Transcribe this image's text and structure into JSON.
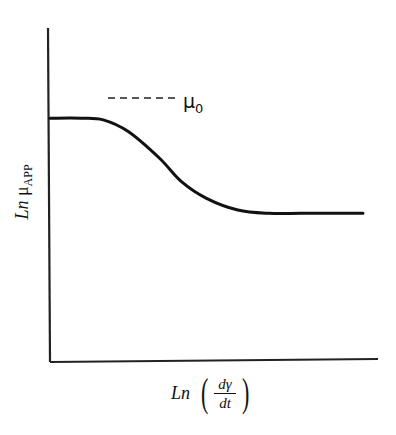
{
  "chart_data": {
    "type": "line",
    "title": "",
    "xlabel": "Ln (dγ/dt)",
    "ylabel": "Ln μAPP",
    "xlabel_parts": {
      "prefix": "Ln",
      "numerator": "dγ",
      "denominator": "dt"
    },
    "ylabel_parts": {
      "prefix": "Ln",
      "symbol": "μ",
      "subscript": "APP"
    },
    "annotation": {
      "symbol": "μ",
      "subscript": "0",
      "text": "μ0",
      "style": "dashed leader line to upper plateau"
    },
    "grid": false,
    "legend": null,
    "axis_ticks": "none",
    "series": [
      {
        "name": "Ln μAPP",
        "x": [
          0.0,
          0.1,
          0.17,
          0.25,
          0.35,
          0.42,
          0.5,
          0.6,
          0.7,
          0.8,
          0.9,
          1.0
        ],
        "y": [
          0.73,
          0.73,
          0.725,
          0.69,
          0.61,
          0.54,
          0.49,
          0.455,
          0.445,
          0.445,
          0.445,
          0.445
        ]
      }
    ],
    "xlim": [
      0,
      1
    ],
    "ylim": [
      0,
      1
    ]
  },
  "labels": {
    "y_prefix": "Ln",
    "y_symbol": "μ",
    "y_sub": "APP",
    "x_prefix": "Ln",
    "x_num": "dγ",
    "x_den": "dt",
    "paren_open": "(",
    "paren_close": ")",
    "mu0_symbol": "μ",
    "mu0_sub": "0"
  }
}
